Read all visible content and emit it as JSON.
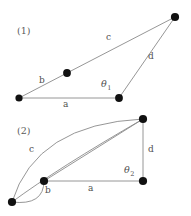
{
  "figure": {
    "background_color": "#ffffff",
    "line_color": "#8a8a8a",
    "node_color": "#111111",
    "label_color": "#4f4f4f",
    "width": 191,
    "height": 216
  },
  "panels": [
    {
      "id": "panel-1",
      "caption": "(1)",
      "caption_pos": {
        "x": 17,
        "y": 26
      },
      "nodes": [
        {
          "name": "node-left",
          "x": 19,
          "y": 98
        },
        {
          "name": "node-mid-upper",
          "x": 67,
          "y": 73
        },
        {
          "name": "node-top-right",
          "x": 175,
          "y": 17
        },
        {
          "name": "node-bottom-right",
          "x": 119,
          "y": 98
        }
      ],
      "edges": [
        {
          "name": "edge-a",
          "from": [
            19,
            98
          ],
          "to": [
            119,
            98
          ]
        },
        {
          "name": "edge-b",
          "from": [
            19,
            98
          ],
          "to": [
            67,
            73
          ]
        },
        {
          "name": "edge-c",
          "from": [
            67,
            73
          ],
          "to": [
            175,
            17
          ]
        },
        {
          "name": "edge-d",
          "from": [
            175,
            17
          ],
          "to": [
            119,
            98
          ]
        }
      ],
      "labels": [
        {
          "name": "label-a",
          "text": "a",
          "x": 63,
          "y": 100
        },
        {
          "name": "label-b",
          "text": "b",
          "x": 39,
          "y": 76
        },
        {
          "name": "label-c",
          "text": "c",
          "x": 106,
          "y": 33
        },
        {
          "name": "label-d",
          "text": "d",
          "x": 148,
          "y": 52
        },
        {
          "name": "label-theta1",
          "text": "θ",
          "sub": "1",
          "x": 101,
          "y": 79
        }
      ]
    },
    {
      "id": "panel-2",
      "caption": "(2)",
      "caption_pos": {
        "x": 17,
        "y": 126
      },
      "nodes": [
        {
          "name": "node-bottom-left",
          "x": 12,
          "y": 202
        },
        {
          "name": "node-junction-b",
          "x": 44,
          "y": 181
        },
        {
          "name": "node-top-right",
          "x": 143,
          "y": 119
        },
        {
          "name": "node-bottom-right",
          "x": 143,
          "y": 181
        }
      ],
      "edges": [
        {
          "name": "edge-a",
          "from": [
            44,
            181
          ],
          "to": [
            143,
            181
          ]
        },
        {
          "name": "edge-d",
          "from": [
            143,
            119
          ],
          "to": [
            143,
            181
          ]
        },
        {
          "name": "edge-diagonal",
          "from": [
            44,
            181
          ],
          "to": [
            143,
            119
          ]
        }
      ],
      "arcs": [
        {
          "name": "arc-c-outer",
          "from": [
            12,
            202
          ],
          "to": [
            143,
            119
          ],
          "control": [
            36,
            124
          ]
        },
        {
          "name": "arc-c-inner",
          "from": [
            12,
            202
          ],
          "to": [
            143,
            119
          ],
          "control": [
            58,
            168
          ]
        },
        {
          "name": "arc-b-loop",
          "from": [
            12,
            202
          ],
          "to": [
            44,
            181
          ],
          "control": [
            44,
            206
          ]
        }
      ],
      "labels": [
        {
          "name": "label-a",
          "text": "a",
          "x": 88,
          "y": 184
        },
        {
          "name": "label-b",
          "text": "b",
          "x": 45,
          "y": 186
        },
        {
          "name": "label-c",
          "text": "c",
          "x": 29,
          "y": 145
        },
        {
          "name": "label-d",
          "text": "d",
          "x": 148,
          "y": 145
        },
        {
          "name": "label-theta2",
          "text": "θ",
          "sub": "2",
          "x": 124,
          "y": 165
        }
      ]
    }
  ]
}
